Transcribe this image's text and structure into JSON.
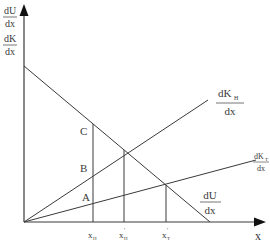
{
  "diagram": {
    "y_axis": {
      "label_top": {
        "num": "dU",
        "den": "dx"
      },
      "label_bottom": {
        "num": "dK",
        "den": "dx"
      }
    },
    "x_axis": {
      "label": "x"
    },
    "curves": {
      "dU": {
        "num": "dU",
        "den": "dx"
      },
      "dKH": {
        "num": "dK",
        "sub": "H",
        "den": "dx"
      },
      "dKT": {
        "num": "dK",
        "sub": "T",
        "den": "dx"
      }
    },
    "points": {
      "A": "A",
      "B": "B",
      "C": "C"
    },
    "x_ticks": {
      "xH": {
        "base": "x",
        "sub": "H",
        "sup": ""
      },
      "xHp": {
        "base": "x",
        "sub": "H",
        "sup": "'"
      },
      "xTp": {
        "base": "x",
        "sub": "T",
        "sup": "'"
      }
    },
    "colors": {
      "line": "#3a3a3a",
      "text": "#3a3a3a",
      "background": "#ffffff"
    }
  }
}
